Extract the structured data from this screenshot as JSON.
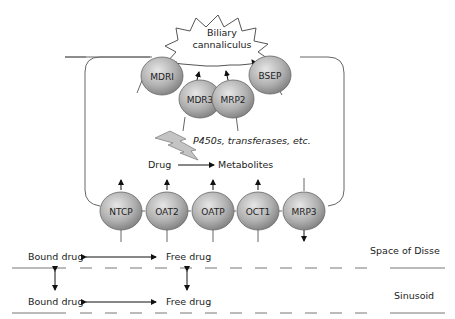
{
  "canaliculus": {
    "line1": "Biliary",
    "line2": "cannaliculus"
  },
  "apical_transporters": [
    {
      "label": "MDRI"
    },
    {
      "label": "MDR3"
    },
    {
      "label": "MRP2"
    },
    {
      "label": "BSEP"
    }
  ],
  "metabolism": {
    "enzymes": "P450s, transferases, etc.",
    "drug": "Drug",
    "metabolites": "Metabolites"
  },
  "basolateral_transporters": [
    {
      "label": "NTCP"
    },
    {
      "label": "OAT2"
    },
    {
      "label": "OATP"
    },
    {
      "label": "OCT1"
    },
    {
      "label": "MRP3"
    }
  ],
  "compartments": {
    "space_of_disse": {
      "label": "Space of Disse",
      "bound": "Bound drug",
      "free": "Free drug"
    },
    "sinusoid": {
      "label": "Sinusoid",
      "bound": "Bound drug",
      "free": "Free drug"
    }
  },
  "colors": {
    "sphere_light": "#d9d9d9",
    "sphere_dark": "#8a8a8a",
    "outline": "#555555",
    "lightning": "#bdbdbd"
  }
}
